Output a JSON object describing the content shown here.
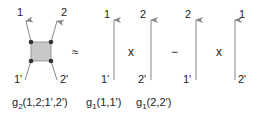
{
  "diagram": {
    "vertex": {
      "labels_top": [
        "1",
        "2"
      ],
      "labels_bottom": [
        "1'",
        "2'"
      ],
      "box_fill": "#c8c8c8"
    },
    "approx_symbol": "≈",
    "times_symbol": "x",
    "minus_symbol": "−",
    "arrows": [
      {
        "top": "1",
        "bottom": "1'"
      },
      {
        "top": "2",
        "bottom": "2'"
      },
      {
        "top": "2",
        "bottom": "1'"
      },
      {
        "top": "1",
        "bottom": "2'"
      }
    ],
    "captions": {
      "g2": {
        "base": "g",
        "sub": "2",
        "args": "(1,2;1',2')"
      },
      "g1a": {
        "base": "g",
        "sub": "1",
        "args": "(1,1')"
      },
      "g1b": {
        "base": "g",
        "sub": "1",
        "args": "(2,2')"
      }
    },
    "line_color": "#888888",
    "dot_color": "#333333"
  }
}
